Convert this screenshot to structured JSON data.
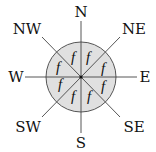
{
  "diagram": {
    "type": "compass-rose",
    "center": [
      81,
      77
    ],
    "circle_radius": 35,
    "circle_fill": "#e0e0e0",
    "line_color": "#444444",
    "directions": {
      "n": "N",
      "ne": "NE",
      "e": "E",
      "se": "SE",
      "s": "S",
      "sw": "SW",
      "w": "W",
      "nw": "NW"
    },
    "sector_label": "f",
    "sectors": [
      {
        "position": "N-NE",
        "label": "f"
      },
      {
        "position": "NE-E",
        "label": "f"
      },
      {
        "position": "E-SE",
        "label": "f"
      },
      {
        "position": "SE-S",
        "label": "f"
      },
      {
        "position": "S-SW",
        "label": "f"
      },
      {
        "position": "SW-W",
        "label": "f"
      },
      {
        "position": "W-NW",
        "label": "f"
      },
      {
        "position": "NW-N",
        "label": "f"
      }
    ]
  }
}
